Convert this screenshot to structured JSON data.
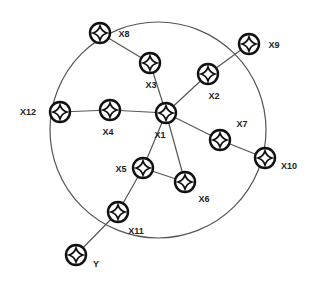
{
  "diagram": {
    "type": "network-topology",
    "boundary": {
      "cx": 158,
      "cy": 130,
      "r": 108,
      "stroke": "#555555"
    },
    "node_style": {
      "outer_r": 10,
      "stroke": "#111111",
      "icon": "four-point-star-icon"
    },
    "nodes": [
      {
        "id": "X1",
        "label": "X1",
        "x": 166,
        "y": 113,
        "lx": 160,
        "ly": 138
      },
      {
        "id": "X2",
        "label": "X2",
        "x": 208,
        "y": 74,
        "lx": 214,
        "ly": 99
      },
      {
        "id": "X3",
        "label": "X3",
        "x": 150,
        "y": 63,
        "lx": 151,
        "ly": 88
      },
      {
        "id": "X4",
        "label": "X4",
        "x": 110,
        "y": 110,
        "lx": 108,
        "ly": 135
      },
      {
        "id": "X5",
        "label": "X5",
        "x": 143,
        "y": 168,
        "lx": 121,
        "ly": 172
      },
      {
        "id": "X6",
        "label": "X6",
        "x": 185,
        "y": 182,
        "lx": 204,
        "ly": 202
      },
      {
        "id": "X7",
        "label": "X7",
        "x": 220,
        "y": 140,
        "lx": 242,
        "ly": 127
      },
      {
        "id": "X8",
        "label": "X8",
        "x": 100,
        "y": 33,
        "lx": 124,
        "ly": 37
      },
      {
        "id": "X9",
        "label": "X9",
        "x": 249,
        "y": 44,
        "lx": 274,
        "ly": 48
      },
      {
        "id": "X10",
        "label": "X10",
        "x": 265,
        "y": 158,
        "lx": 289,
        "ly": 169
      },
      {
        "id": "X11",
        "label": "X11",
        "x": 118,
        "y": 212,
        "lx": 136,
        "ly": 234
      },
      {
        "id": "X12",
        "label": "X12",
        "x": 60,
        "y": 112,
        "lx": 28,
        "ly": 115
      },
      {
        "id": "Y",
        "label": "Y",
        "x": 76,
        "y": 255,
        "lx": 96,
        "ly": 267
      }
    ],
    "edges": [
      [
        "X1",
        "X2"
      ],
      [
        "X1",
        "X3"
      ],
      [
        "X1",
        "X4"
      ],
      [
        "X1",
        "X5"
      ],
      [
        "X1",
        "X6"
      ],
      [
        "X1",
        "X7"
      ],
      [
        "X2",
        "X9"
      ],
      [
        "X3",
        "X8"
      ],
      [
        "X4",
        "X12"
      ],
      [
        "X5",
        "X6"
      ],
      [
        "X5",
        "X11"
      ],
      [
        "X7",
        "X10"
      ],
      [
        "X11",
        "Y"
      ]
    ]
  }
}
